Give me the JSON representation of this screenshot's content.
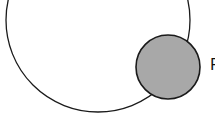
{
  "diagram": {
    "large_circle": {
      "cx": 98,
      "cy": 20,
      "r": 92,
      "fill": "#ffffff",
      "stroke": "#1a1a1a"
    },
    "small_circle": {
      "cx": 168,
      "cy": 67,
      "r": 32,
      "fill": "#a8a8a8",
      "stroke": "#1a1a1a"
    },
    "label": "P"
  }
}
